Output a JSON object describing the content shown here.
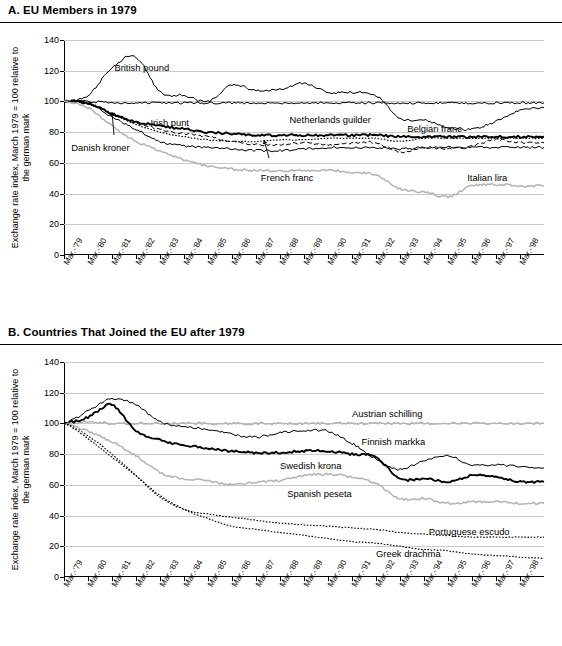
{
  "panels": [
    {
      "id": "A",
      "title": "A. EU Members in 1979",
      "ylabel": "Exchange rate index, March 1979 = 100 relative to the german mark",
      "chart_index": 0
    },
    {
      "id": "B",
      "title": "B. Countries That Joined the EU after 1979",
      "ylabel": "Exchange rate index, March 1979 = 100 relative to the german mark",
      "chart_index": 1
    }
  ],
  "chart_data": [
    {
      "type": "line",
      "title": "A. EU Members in 1979",
      "xlabel": "",
      "ylabel": "Exchange rate index, March 1979 = 100 relative to the german mark",
      "ylim": [
        0,
        140
      ],
      "yticks": [
        0,
        20,
        40,
        60,
        80,
        100,
        120,
        140
      ],
      "grid": true,
      "legend": "inline-annotations",
      "xticklabels": [
        "Mar.-'79",
        "Mar.-'80",
        "Mar.-'81",
        "Mar.-'82",
        "Mar.-'83",
        "Mar.-'84",
        "Mar.-'85",
        "Mar.-'86",
        "Mar.-'87",
        "Mar.-'88",
        "Mar.-'89",
        "Mar.-'90",
        "Mar.-'91",
        "Mar.-'92",
        "Mar.-'93",
        "Mar.-'94",
        "Mar.-'95",
        "Mar.-'96",
        "Mar.-'97",
        "Mar.-'98"
      ],
      "x": [
        1979,
        1980,
        1981,
        1982,
        1983,
        1984,
        1985,
        1986,
        1987,
        1988,
        1989,
        1990,
        1991,
        1992,
        1993,
        1994,
        1995,
        1996,
        1997,
        1998,
        1999
      ],
      "series": [
        {
          "name": "British pound",
          "values": [
            100,
            104,
            122,
            129,
            106,
            104,
            100,
            111,
            107,
            108,
            112,
            106,
            106,
            104,
            89,
            88,
            83,
            82,
            87,
            94,
            96
          ],
          "style": "solid-thin"
        },
        {
          "name": "Danish kroner",
          "values": [
            100,
            99,
            92,
            87,
            84,
            82,
            80,
            79,
            78,
            78,
            78,
            78,
            78,
            78,
            77,
            77,
            77,
            77,
            77,
            77,
            77
          ],
          "style": "solid-bold"
        },
        {
          "name": "Irish punt",
          "values": [
            100,
            99,
            92,
            86,
            82,
            79,
            77,
            74,
            72,
            72,
            73,
            72,
            73,
            73,
            67,
            70,
            69,
            71,
            75,
            73,
            73
          ],
          "style": "dashed"
        },
        {
          "name": "Netherlands guilder",
          "values": [
            100,
            100,
            99,
            99,
            99,
            99,
            99,
            99,
            99,
            99,
            99,
            99,
            99,
            99,
            99,
            99,
            99,
            99,
            99,
            99,
            99
          ],
          "style": "solid-thin"
        },
        {
          "name": "Belgian franc",
          "values": [
            100,
            99,
            92,
            85,
            80,
            77,
            75,
            74,
            74,
            75,
            75,
            76,
            76,
            76,
            74,
            76,
            76,
            76,
            76,
            76,
            76
          ],
          "style": "dotted"
        },
        {
          "name": "French franc",
          "values": [
            100,
            99,
            90,
            82,
            74,
            71,
            70,
            69,
            68,
            68,
            69,
            70,
            70,
            70,
            69,
            70,
            70,
            70,
            70,
            70,
            70
          ],
          "style": "solid-thin"
        },
        {
          "name": "Italian lira",
          "values": [
            100,
            96,
            84,
            74,
            68,
            62,
            58,
            56,
            55,
            55,
            55,
            55,
            54,
            52,
            43,
            41,
            38,
            45,
            46,
            45,
            45
          ],
          "style": "solid-gray"
        }
      ],
      "annotations": [
        {
          "text": "British pound",
          "x": 1981.1,
          "y": 122
        },
        {
          "text": "Danish kroner",
          "x": 1979.3,
          "y": 70
        },
        {
          "text": "Irish punt",
          "x": 1982.6,
          "y": 86
        },
        {
          "text": "Netherlands guilder",
          "x": 1988.4,
          "y": 88
        },
        {
          "text": "Belgian franc",
          "x": 1993.3,
          "y": 82
        },
        {
          "text": "French franc",
          "x": 1987.2,
          "y": 50
        },
        {
          "text": "Italian lira",
          "x": 1995.8,
          "y": 50
        }
      ]
    },
    {
      "type": "line",
      "title": "B. Countries That Joined the EU after 1979",
      "xlabel": "",
      "ylabel": "Exchange rate index, March 1979 = 100 relative to the german mark",
      "ylim": [
        0,
        140
      ],
      "yticks": [
        0,
        20,
        40,
        60,
        80,
        100,
        120,
        140
      ],
      "grid": true,
      "legend": "inline-annotations",
      "xticklabels": [
        "Mar.-'79",
        "Mar.-'80",
        "Mar.-'81",
        "Mar.-'82",
        "Mar.-'83",
        "Mar.-'84",
        "Mar.-'85",
        "Mar.-'86",
        "Mar.-'87",
        "Mar.-'88",
        "Mar.-'89",
        "Mar.-'90",
        "Mar.-'91",
        "Mar.-'92",
        "Mar.-'93",
        "Mar.-'94",
        "Mar.-'95",
        "Mar.-'96",
        "Mar.-'97",
        "Mar.-'98"
      ],
      "x": [
        1979,
        1980,
        1981,
        1982,
        1983,
        1984,
        1985,
        1986,
        1987,
        1988,
        1989,
        1990,
        1991,
        1992,
        1993,
        1994,
        1995,
        1996,
        1997,
        1998,
        1999
      ],
      "series": [
        {
          "name": "Austrian schilling",
          "values": [
            100,
            101,
            100,
            100,
            100,
            100,
            100,
            100,
            100,
            100,
            100,
            100,
            100,
            100,
            100,
            100,
            100,
            100,
            100,
            100,
            100
          ],
          "style": "solid-gray"
        },
        {
          "name": "Finnish markka",
          "values": [
            100,
            108,
            116,
            112,
            101,
            98,
            96,
            93,
            91,
            94,
            95,
            95,
            87,
            77,
            70,
            76,
            79,
            73,
            73,
            72,
            71
          ],
          "style": "solid-thin"
        },
        {
          "name": "Swedish krona",
          "values": [
            100,
            104,
            112,
            95,
            89,
            86,
            84,
            82,
            81,
            81,
            82,
            82,
            80,
            78,
            64,
            64,
            62,
            66,
            65,
            62,
            62
          ],
          "style": "solid-bold"
        },
        {
          "name": "Spanish peseta",
          "values": [
            100,
            95,
            88,
            79,
            68,
            64,
            63,
            60,
            62,
            63,
            66,
            67,
            65,
            61,
            51,
            51,
            48,
            49,
            49,
            48,
            48
          ],
          "style": "solid-gray"
        },
        {
          "name": "Portuguese escudo",
          "values": [
            100,
            92,
            80,
            66,
            52,
            44,
            41,
            39,
            37,
            35,
            34,
            33,
            32,
            31,
            29,
            28,
            27,
            26,
            26,
            26,
            26
          ],
          "style": "dotted"
        },
        {
          "name": "Greek drachma",
          "values": [
            100,
            90,
            78,
            66,
            53,
            44,
            38,
            33,
            31,
            29,
            27,
            25,
            23,
            22,
            20,
            18,
            17,
            15,
            14,
            13,
            12
          ],
          "style": "dotted"
        }
      ],
      "annotations": [
        {
          "text": "Austrian schilling",
          "x": 1991.0,
          "y": 106
        },
        {
          "text": "Finnish markka",
          "x": 1991.4,
          "y": 88
        },
        {
          "text": "Swedish krona",
          "x": 1988.0,
          "y": 72
        },
        {
          "text": "Spanish peseta",
          "x": 1988.3,
          "y": 54
        },
        {
          "text": "Portuguese escudo",
          "x": 1994.2,
          "y": 29
        },
        {
          "text": "Greek drachma",
          "x": 1992.0,
          "y": 15
        }
      ]
    }
  ]
}
